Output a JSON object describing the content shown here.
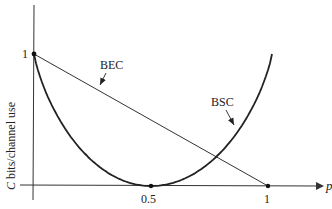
{
  "chart_data": {
    "type": "line",
    "title": "",
    "xlabel": "p",
    "ylabel": "C bits/channel use",
    "xlim": [
      0,
      1
    ],
    "ylim": [
      0,
      1
    ],
    "x_ticks": [
      "0.5",
      "1"
    ],
    "y_ticks": [
      "1"
    ],
    "grid": false,
    "legend": "inline annotations with arrows",
    "series": [
      {
        "name": "BEC",
        "description": "C = 1 - p (straight line)",
        "x": [
          0,
          0.25,
          0.5,
          0.75,
          1
        ],
        "values": [
          1,
          0.75,
          0.5,
          0.25,
          0
        ]
      },
      {
        "name": "BSC",
        "description": "C = 1 - H(p) (U-shaped curve)",
        "x": [
          0,
          0.1,
          0.2,
          0.3,
          0.4,
          0.5,
          0.6,
          0.7,
          0.8,
          0.9,
          1
        ],
        "values": [
          1,
          0.531,
          0.278,
          0.119,
          0.029,
          0,
          0.029,
          0.119,
          0.278,
          0.531,
          1
        ]
      }
    ],
    "annotations": [
      {
        "text": "BEC",
        "points_to": "BEC line"
      },
      {
        "text": "BSC",
        "points_to": "BSC curve"
      }
    ]
  },
  "labels": {
    "y_axis": "C bits/channel use",
    "y_axis_italic_part": "C",
    "y_axis_rest": " bits/channel use",
    "x_axis": "p",
    "y_tick_1": "1",
    "x_tick_05": "0.5",
    "x_tick_1": "1",
    "bec": "BEC",
    "bsc": "BSC"
  }
}
